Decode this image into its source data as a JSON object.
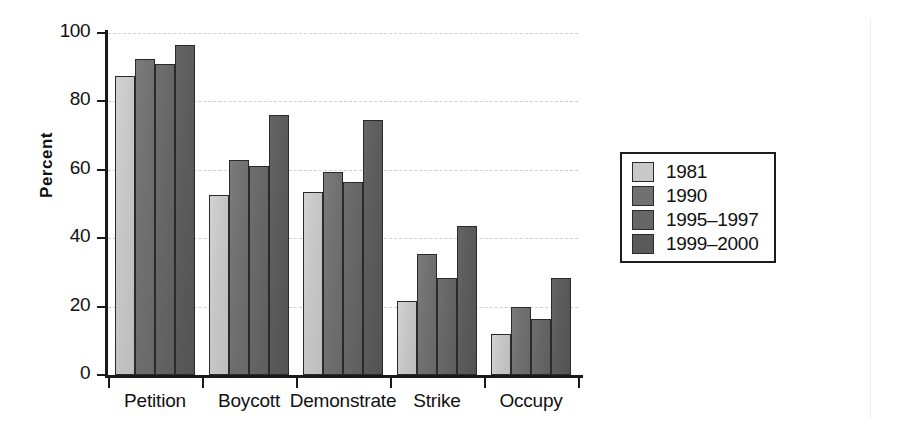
{
  "axis": {
    "y_title": "Percent",
    "y_ticks": [
      "100",
      "80",
      "60",
      "40",
      "20",
      "0"
    ],
    "x_labels": [
      "Petition",
      "Boycott",
      "Demonstrate",
      "Strike",
      "Occupy"
    ]
  },
  "legend": {
    "items": [
      {
        "label": "1981",
        "color": "#c8c8c8"
      },
      {
        "label": "1990",
        "color": "#707070"
      },
      {
        "label": "1995–1997",
        "color": "#666666"
      },
      {
        "label": "1999–2000",
        "color": "#5a5a5a"
      }
    ]
  },
  "chart_data": {
    "type": "bar",
    "title": "",
    "xlabel": "",
    "ylabel": "Percent",
    "ylim": [
      0,
      100
    ],
    "yticks": [
      0,
      20,
      40,
      60,
      80,
      100
    ],
    "grid": true,
    "legend_position": "right",
    "categories": [
      "Petition",
      "Boycott",
      "Demonstrate",
      "Strike",
      "Occupy"
    ],
    "series": [
      {
        "name": "1981",
        "color": "#c8c8c8",
        "values": [
          87.5,
          52.5,
          53.5,
          21.5,
          12.0
        ]
      },
      {
        "name": "1990",
        "color": "#707070",
        "values": [
          92.5,
          63.0,
          59.5,
          35.5,
          20.0
        ]
      },
      {
        "name": "1995–1997",
        "color": "#666666",
        "values": [
          91.0,
          61.0,
          56.5,
          28.5,
          16.5
        ]
      },
      {
        "name": "1999–2000",
        "color": "#5a5a5a",
        "values": [
          96.5,
          76.0,
          74.5,
          43.5,
          28.5
        ]
      }
    ]
  }
}
